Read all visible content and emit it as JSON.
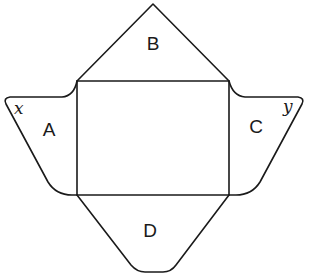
{
  "diagram": {
    "panels": {
      "center": "",
      "top": "B",
      "left": "A",
      "right": "C",
      "bottom": "D"
    },
    "corner_labels": {
      "left": "x",
      "right": "y"
    }
  }
}
